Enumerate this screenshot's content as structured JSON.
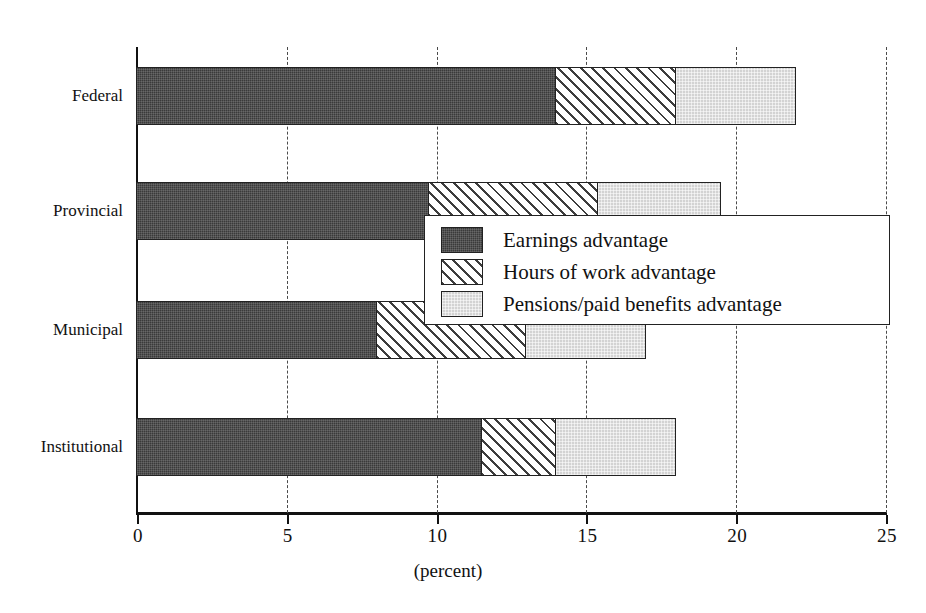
{
  "chart_data": {
    "type": "bar",
    "orientation": "horizontal",
    "stacked": true,
    "title": "",
    "xlabel": "(percent)",
    "ylabel": "",
    "xlim": [
      0,
      25
    ],
    "xticks": [
      0,
      5,
      10,
      15,
      20,
      25
    ],
    "xtick_labels": [
      "0",
      "5",
      "10",
      "15",
      "20",
      "25"
    ],
    "grid": "vertical-dashed",
    "legend_position": "center-right-overlay",
    "categories": [
      "Federal",
      "Provincial",
      "Municipal",
      "Institutional"
    ],
    "series": [
      {
        "name": "Earnings advantage",
        "fill": "dark-solid",
        "color": "#3a3a3a",
        "values": [
          14.0,
          9.75,
          8.0,
          11.5
        ]
      },
      {
        "name": "Hours of work advantage",
        "fill": "diagonal-hatch",
        "color": "#ffffff",
        "values": [
          4.0,
          5.65,
          5.0,
          2.5
        ]
      },
      {
        "name": "Pensions/paid benefits advantage",
        "fill": "light-stipple",
        "color": "#d3d3d3",
        "values": [
          4.0,
          4.1,
          4.0,
          4.0
        ]
      }
    ],
    "totals": [
      22.0,
      19.5,
      17.0,
      18.0
    ]
  },
  "axis": {
    "x_title": "(percent)"
  },
  "legend": {
    "items": [
      {
        "label": "Earnings advantage"
      },
      {
        "label": "Hours of work advantage"
      },
      {
        "label": "Pensions/paid benefits advantage"
      }
    ]
  }
}
